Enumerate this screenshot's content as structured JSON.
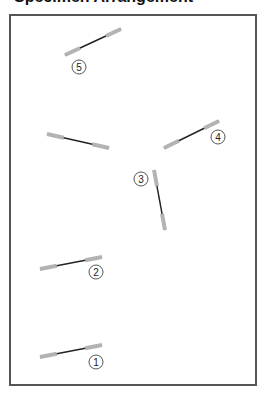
{
  "title": "Specimen Arrangement",
  "colors": {
    "frame": "#555555",
    "grip": "#b3b3b3",
    "gauge": "#222222",
    "label_ring": "#555555",
    "label_text": "#222222"
  },
  "specimens": [
    {
      "id": "1",
      "label": "1",
      "x1": 40,
      "y1": 357,
      "x2": 102,
      "y2": 345,
      "lx": 96,
      "ly": 362
    },
    {
      "id": "2",
      "label": "2",
      "x1": 40,
      "y1": 269,
      "x2": 102,
      "y2": 257,
      "lx": 96,
      "ly": 272
    },
    {
      "id": "3",
      "label": "3",
      "x1": 154,
      "y1": 170,
      "x2": 165,
      "y2": 230,
      "lx": 141,
      "ly": 179
    },
    {
      "id": "4",
      "label": "4",
      "x1": 164,
      "y1": 148,
      "x2": 219,
      "y2": 121,
      "lx": 218,
      "ly": 137
    },
    {
      "id": "5",
      "label": "5",
      "x1": 65,
      "y1": 55,
      "x2": 121,
      "y2": 29,
      "lx": 79,
      "ly": 67
    },
    {
      "id": "unlabeled",
      "label": "",
      "x1": 47,
      "y1": 134,
      "x2": 109,
      "y2": 148
    }
  ]
}
